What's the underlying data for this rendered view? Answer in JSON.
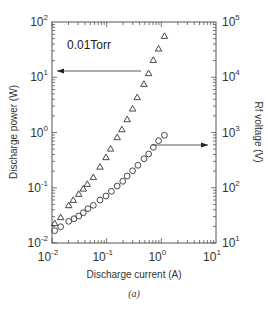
{
  "chart_data": {
    "type": "scatter",
    "title": "",
    "caption": "(a)",
    "annotation": "0.01Torr",
    "xlabel": "Discharge current (A)",
    "ylabel_left": "Discharge power (W)",
    "ylabel_right": "Rf voltage (V)",
    "xscale": "log",
    "yscale": "log",
    "xlim": [
      0.01,
      10
    ],
    "ylim_left": [
      0.01,
      100
    ],
    "ylim_right": [
      10,
      100000
    ],
    "grid": false,
    "x_ticks": [
      {
        "base": "10",
        "exp": "-2",
        "value": 0.01
      },
      {
        "base": "10",
        "exp": "-1",
        "value": 0.1
      },
      {
        "base": "10",
        "exp": "0",
        "value": 1
      },
      {
        "base": "10",
        "exp": "1",
        "value": 10
      }
    ],
    "y_left_ticks": [
      {
        "base": "10",
        "exp": "-2",
        "value": 0.01
      },
      {
        "base": "10",
        "exp": "-1",
        "value": 0.1
      },
      {
        "base": "10",
        "exp": "0",
        "value": 1
      },
      {
        "base": "10",
        "exp": "1",
        "value": 10
      },
      {
        "base": "10",
        "exp": "2",
        "value": 100
      }
    ],
    "y_right_ticks": [
      {
        "base": "10",
        "exp": "1",
        "value": 10
      },
      {
        "base": "10",
        "exp": "2",
        "value": 100
      },
      {
        "base": "10",
        "exp": "3",
        "value": 1000
      },
      {
        "base": "10",
        "exp": "4",
        "value": 10000
      },
      {
        "base": "10",
        "exp": "5",
        "value": 100000
      }
    ],
    "series": [
      {
        "name": "Discharge power",
        "marker": "triangle",
        "axis": "left",
        "x": [
          0.0112,
          0.0144,
          0.0202,
          0.0245,
          0.0308,
          0.0374,
          0.0442,
          0.057,
          0.0754,
          0.0971,
          0.118,
          0.156,
          0.19,
          0.237,
          0.298,
          0.362,
          0.481,
          0.586,
          0.713,
          0.89,
          1.14
        ],
        "y": [
          0.0228,
          0.0292,
          0.0481,
          0.06,
          0.0771,
          0.0962,
          0.117,
          0.155,
          0.24,
          0.356,
          0.509,
          0.819,
          1.14,
          1.73,
          2.7,
          4.34,
          7.55,
          11.8,
          20.5,
          32.9,
          55.8
        ]
      },
      {
        "name": "Rf voltage",
        "marker": "circle",
        "axis": "right",
        "x": [
          0.0112,
          0.0144,
          0.0202,
          0.0253,
          0.0308,
          0.0374,
          0.0455,
          0.057,
          0.0754,
          0.0971,
          0.122,
          0.156,
          0.197,
          0.237,
          0.298,
          0.373,
          0.481,
          0.586,
          0.713,
          0.89,
          1.14
        ],
        "y": [
          16.7,
          19.7,
          24.7,
          27.5,
          30.8,
          35.3,
          41.8,
          48.1,
          60.0,
          70.9,
          86.3,
          107.6,
          130.9,
          163,
          203,
          255,
          335,
          408,
          540,
          711,
          890
        ]
      }
    ],
    "arrows": [
      {
        "label": "points to left axis (power)",
        "direction": "left",
        "y_px": 71,
        "x_from_px": 141,
        "x_to_px": 57
      },
      {
        "label": "points to right axis (voltage)",
        "direction": "right",
        "y_px": 145,
        "x_from_px": 152,
        "x_to_px": 208
      }
    ]
  }
}
